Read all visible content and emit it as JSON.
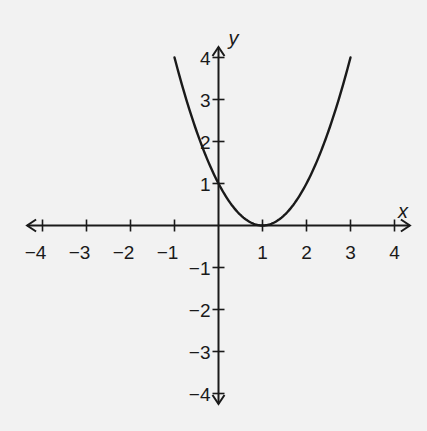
{
  "chart_data": {
    "type": "line",
    "title": "",
    "xlabel": "x",
    "ylabel": "y",
    "xlim": [
      -4,
      4
    ],
    "ylim": [
      -4,
      4
    ],
    "grid": false,
    "x_ticks": [
      -4,
      -3,
      -2,
      -1,
      1,
      2,
      3,
      4
    ],
    "y_ticks": [
      -4,
      -3,
      -2,
      -1,
      1,
      2,
      3,
      4
    ],
    "x_tick_labels": [
      "−4",
      "−3",
      "−2",
      "−1",
      "1",
      "2",
      "3",
      "4"
    ],
    "y_tick_labels": [
      "−4",
      "−3",
      "−2",
      "−1",
      "1",
      "2",
      "3",
      "4"
    ],
    "series": [
      {
        "name": "y = (x − 1)²",
        "x": [
          -1,
          -0.5,
          0,
          0.5,
          1,
          1.5,
          2,
          2.5,
          3
        ],
        "y": [
          4,
          2.25,
          1,
          0.25,
          0,
          0.25,
          1,
          2.25,
          4
        ]
      }
    ],
    "axis_arrows": true
  },
  "labels": {
    "x_axis": "x",
    "y_axis": "y"
  }
}
